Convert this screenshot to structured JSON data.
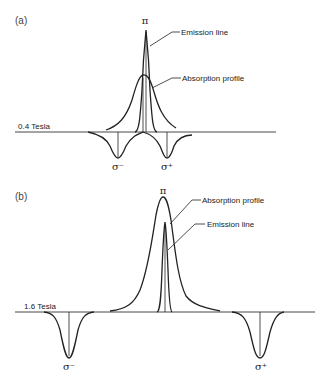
{
  "panels": [
    {
      "label": "(a)",
      "field_label": "0.4 Tesla",
      "pi_label": "π",
      "sigma_minus_label": "σ⁻",
      "sigma_plus_label": "σ⁺",
      "annotations": {
        "emission": "Emission line",
        "absorption": "Absorption profile"
      }
    },
    {
      "label": "(b)",
      "field_label": "1.6 Tesla",
      "pi_label": "π",
      "sigma_minus_label": "σ⁻",
      "sigma_plus_label": "σ⁺",
      "annotations": {
        "absorption": "Absorption profile",
        "emission": "Emission line"
      }
    }
  ]
}
